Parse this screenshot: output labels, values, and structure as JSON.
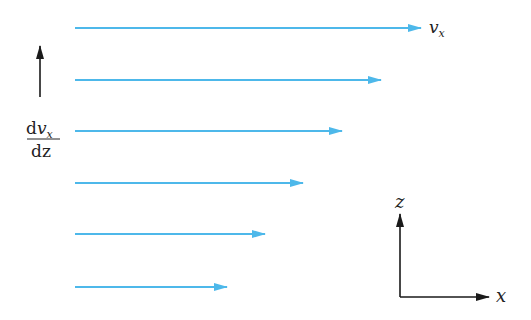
{
  "diagram": {
    "arrow_color": "#4db8ea",
    "axis_color": "#1a1a1a",
    "velocity_arrows": [
      {
        "y": 28,
        "x_start": 75,
        "x_end": 421
      },
      {
        "y": 80,
        "x_start": 75,
        "x_end": 381
      },
      {
        "y": 131,
        "x_start": 75,
        "x_end": 342
      },
      {
        "y": 183,
        "x_start": 75,
        "x_end": 303
      },
      {
        "y": 234,
        "x_start": 75,
        "x_end": 265
      },
      {
        "y": 287,
        "x_start": 75,
        "x_end": 227
      }
    ],
    "labels": {
      "velocity": "v",
      "velocity_sub": "x",
      "gradient_num_d": "d",
      "gradient_num_v": "v",
      "gradient_num_sub": "x",
      "gradient_den": "dz",
      "axis_z": "z",
      "axis_x": "x"
    }
  }
}
